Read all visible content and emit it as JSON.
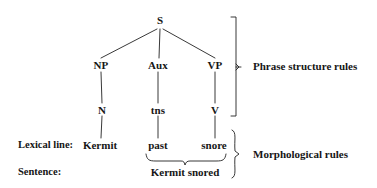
{
  "diagram": {
    "line_color": "#222222",
    "text_color": "#161616",
    "background": "#ffffff"
  },
  "tree": {
    "root": {
      "label": "S",
      "x": 160,
      "y": 20
    },
    "level2": [
      {
        "label": "NP",
        "x": 101,
        "y": 65
      },
      {
        "label": "Aux",
        "x": 158,
        "y": 65
      },
      {
        "label": "VP",
        "x": 215,
        "y": 65
      }
    ],
    "level3": [
      {
        "label": "N",
        "x": 103,
        "y": 110
      },
      {
        "label": "tns",
        "x": 157,
        "y": 110
      },
      {
        "label": "V",
        "x": 215,
        "y": 110
      }
    ]
  },
  "lexical": {
    "row_label": "Lexical line:",
    "row_label_x": 18,
    "row_y": 145,
    "items": [
      {
        "label": "Kermit",
        "x": 100
      },
      {
        "label": "past",
        "x": 158
      },
      {
        "label": "snore",
        "x": 214
      }
    ]
  },
  "sentence": {
    "row_label": "Sentence:",
    "row_label_x": 18,
    "row_y": 172,
    "text": "Kermit snored",
    "text_x": 185
  },
  "brackets": {
    "phrase": {
      "label": "Phrase structure rules",
      "label_x": 253,
      "label_y": 64,
      "spine_x": 236,
      "top_y": 17,
      "bottom_y": 116,
      "tick_y": 67
    },
    "morphological": {
      "label": "Morphological rules",
      "label_x": 253,
      "label_y": 143,
      "spine_x": 236,
      "top_y": 130,
      "bottom_y": 178,
      "tick_y": 154
    },
    "sentence_brace": {
      "left_x": 145,
      "right_x": 226,
      "top_y": 155,
      "point_x": 185,
      "bottom_y": 164
    }
  }
}
